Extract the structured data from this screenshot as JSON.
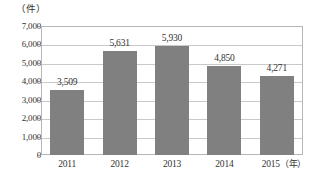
{
  "chart_data": {
    "type": "bar",
    "title": "",
    "subtitle": "",
    "xlabel": "",
    "ylabel": "",
    "unit_label": "（件）",
    "x_unit_label": "（年）",
    "categories": [
      "2011",
      "2012",
      "2013",
      "2014",
      "2015"
    ],
    "values": [
      3509,
      5631,
      5930,
      4850,
      4271
    ],
    "value_labels": [
      "3,509",
      "5,631",
      "5,930",
      "4,850",
      "4,271"
    ],
    "ylim": [
      0,
      7000
    ],
    "ytick_values": [
      0,
      1000,
      2000,
      3000,
      4000,
      5000,
      6000,
      7000
    ],
    "ytick_labels": [
      "0",
      "1,000",
      "2,000",
      "3,000",
      "4,000",
      "5,000",
      "6,000",
      "7,000"
    ],
    "grid": true,
    "grid_axis": "y",
    "legend": false,
    "legend_position": "none",
    "series": [
      {
        "name": "",
        "values": [
          3509,
          5631,
          5930,
          4850,
          4271
        ]
      }
    ],
    "colors": {
      "bar": "#808080",
      "grid": "#c9c9c9",
      "frame": "#b6b6b6",
      "text": "#333333",
      "background": "#ffffff"
    }
  }
}
